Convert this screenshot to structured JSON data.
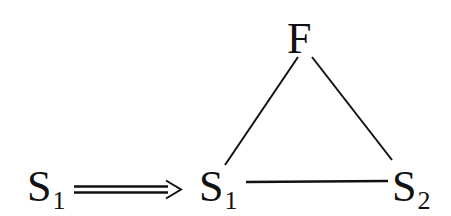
{
  "diagram": {
    "nodes": [
      {
        "id": "s1_source",
        "label": "S",
        "subscript": "1"
      },
      {
        "id": "s1",
        "label": "S",
        "subscript": "1"
      },
      {
        "id": "s2",
        "label": "S",
        "subscript": "2"
      },
      {
        "id": "f",
        "label": "F"
      }
    ],
    "edges": [
      {
        "from": "s1_source",
        "to": "s1",
        "style": "double-arrow"
      },
      {
        "from": "f",
        "to": "s1",
        "style": "line"
      },
      {
        "from": "f",
        "to": "s2",
        "style": "line"
      },
      {
        "from": "s1",
        "to": "s2",
        "style": "line"
      }
    ],
    "colors": {
      "ink": "#111111",
      "background": "#ffffff"
    }
  }
}
